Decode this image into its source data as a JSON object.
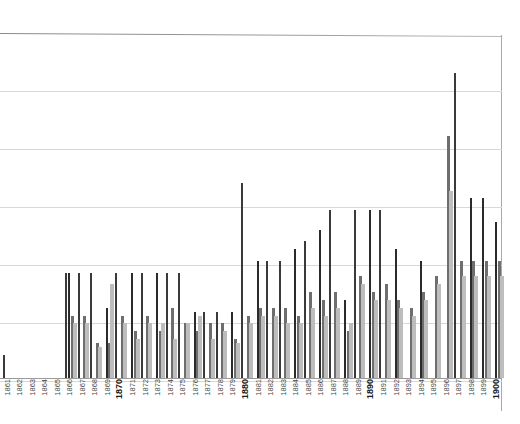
{
  "chart_data": {
    "type": "bar",
    "title": "",
    "subtitle": "",
    "xlabel": "",
    "ylabel": "",
    "grid": true,
    "legend": "none",
    "gridline_count": 6,
    "axis_range_note": "y axis unlabeled; gridlines evenly spaced",
    "categories": [
      "1861",
      "1862",
      "1863",
      "1864",
      "1865",
      "1866",
      "1867",
      "1868",
      "1869",
      "1870",
      "1871",
      "1872",
      "1873",
      "1874",
      "1875",
      "1876",
      "1877",
      "1878",
      "1879",
      "1880",
      "1881",
      "1882",
      "1883",
      "1884",
      "1885",
      "1886",
      "1887",
      "1888",
      "1889",
      "1890",
      "1891",
      "1892",
      "1893",
      "1894",
      "1895",
      "1896",
      "1897",
      "1898",
      "1899",
      "1900"
    ],
    "major_ticks": [
      "1870",
      "1880",
      "1890",
      "1900"
    ],
    "series": [
      {
        "name": "dark-thin",
        "color": "#3a3a3a",
        "values": [
          6,
          0,
          0,
          0,
          0,
          27,
          27,
          27,
          0,
          27,
          0,
          27,
          0,
          27,
          27,
          0,
          17,
          17,
          0,
          50,
          0,
          30,
          30,
          0,
          35,
          0,
          43,
          0,
          43,
          0,
          43,
          0,
          0,
          0,
          0,
          0,
          78,
          0,
          0,
          0
        ]
      },
      {
        "name": "dark-thin-b",
        "color": "#2b2b2b",
        "values": [
          0,
          0,
          0,
          0,
          0,
          27,
          0,
          0,
          18,
          0,
          27,
          0,
          27,
          0,
          0,
          17,
          0,
          0,
          17,
          0,
          30,
          0,
          0,
          33,
          0,
          38,
          0,
          20,
          0,
          43,
          0,
          33,
          0,
          30,
          0,
          0,
          0,
          46,
          46,
          40
        ]
      },
      {
        "name": "mid-gray",
        "color": "#6e6e6e",
        "values": [
          0,
          0,
          0,
          0,
          0,
          16,
          16,
          9,
          9,
          16,
          12,
          16,
          12,
          18,
          14,
          12,
          14,
          14,
          10,
          16,
          18,
          18,
          18,
          16,
          22,
          20,
          22,
          12,
          26,
          22,
          24,
          20,
          18,
          22,
          26,
          62,
          30,
          30,
          30,
          30
        ]
      },
      {
        "name": "light-gray",
        "color": "#bdbdbd",
        "values": [
          0,
          0,
          0,
          0,
          0,
          14,
          14,
          8,
          24,
          14,
          10,
          14,
          14,
          10,
          14,
          16,
          10,
          12,
          9,
          14,
          16,
          16,
          14,
          14,
          18,
          16,
          18,
          14,
          24,
          20,
          20,
          18,
          16,
          20,
          24,
          48,
          26,
          26,
          26,
          26
        ]
      }
    ]
  },
  "axis": {
    "tick_labels": [
      "1861",
      "1862",
      "1863",
      "1864",
      "1865",
      "1866",
      "1867",
      "1868",
      "1869",
      "1870",
      "1871",
      "1872",
      "1873",
      "1874",
      "1875",
      "1876",
      "1877",
      "1878",
      "1879",
      "1880",
      "1881",
      "1882",
      "1883",
      "1884",
      "1885",
      "1886",
      "1887",
      "1888",
      "1889",
      "1890",
      "1891",
      "1892",
      "1893",
      "1894",
      "1895",
      "1896",
      "1897",
      "1898",
      "1899",
      "1900"
    ]
  },
  "colors": {
    "background": "#ffffff",
    "frame": "#8d8d8d",
    "gridline": "#d8d8d8",
    "bar_dark": "#3a3a3a",
    "bar_darker": "#2b2b2b",
    "bar_mid": "#6e6e6e",
    "bar_light": "#bdbdbd",
    "tick_text": "#4a4a4a",
    "tick_text_major": "#1a1a1a"
  }
}
